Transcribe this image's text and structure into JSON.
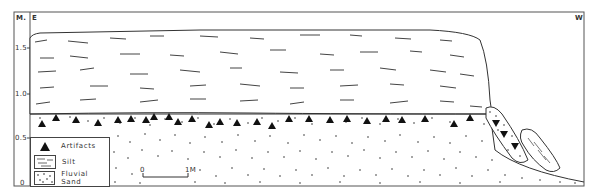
{
  "diagram": {
    "type": "stratigraphic-cross-section",
    "axis": {
      "unit_label": "M.",
      "ticks": [
        {
          "label": "1.5",
          "value": 1.5
        },
        {
          "label": "1.0",
          "value": 1.0
        },
        {
          "label": "0.5",
          "value": 0.5
        },
        {
          "label": "0",
          "value": 0
        }
      ]
    },
    "orientation": {
      "left": "E",
      "right": "W"
    },
    "layers": [
      {
        "name": "Silt",
        "pattern": "dashes",
        "top_m": 1.65,
        "bottom_m": 0.8
      },
      {
        "name": "Fluvial Sand",
        "pattern": "dots",
        "top_m": 0.8,
        "bottom_m": 0
      }
    ],
    "legend": {
      "items": [
        {
          "symbol": "triangle",
          "label": "Artifacts"
        },
        {
          "symbol": "silt-pattern",
          "label": "Silt"
        },
        {
          "symbol": "sand-pattern",
          "label": "Fluvial Sand"
        }
      ]
    },
    "scale_bar": {
      "start_label": "0",
      "end_label": "1M"
    },
    "colors": {
      "line": "#333333",
      "fill": "#ffffff",
      "symbol": "#111111"
    }
  }
}
